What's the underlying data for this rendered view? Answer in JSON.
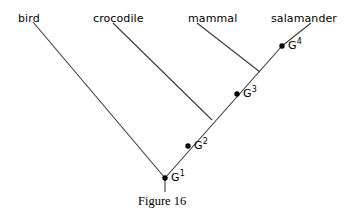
{
  "figure": {
    "caption": "Figure 16",
    "caption_x": 138,
    "caption_y": 194,
    "width": 358,
    "height": 221,
    "background_color": "#ffffff",
    "line_color": "#3a3a3a",
    "text_color": "#000000",
    "node_dot_color": "#000000"
  },
  "taxa": [
    {
      "label": "bird",
      "x": 18,
      "y": 13
    },
    {
      "label": "crocodile",
      "x": 93,
      "y": 13
    },
    {
      "label": "mammal",
      "x": 188,
      "y": 13
    },
    {
      "label": "salamander",
      "x": 271,
      "y": 13
    }
  ],
  "nodes": [
    {
      "label": "G",
      "sup": "1",
      "dot_x": 165,
      "dot_y": 178,
      "label_x": 171,
      "label_y": 172
    },
    {
      "label": "G",
      "sup": "2",
      "dot_x": 188,
      "dot_y": 146,
      "label_x": 194,
      "label_y": 140
    },
    {
      "label": "G",
      "sup": "3",
      "dot_x": 237,
      "dot_y": 94,
      "label_x": 243,
      "label_y": 88
    },
    {
      "label": "G",
      "sup": "4",
      "dot_x": 282,
      "dot_y": 46,
      "label_x": 288,
      "label_y": 40
    }
  ],
  "branches": [
    {
      "name": "bird-branch",
      "x1": 33,
      "y1": 22,
      "x2": 165,
      "y2": 178
    },
    {
      "name": "crocodile-branch",
      "x1": 113,
      "y1": 23,
      "x2": 212,
      "y2": 120
    },
    {
      "name": "mammal-branch",
      "x1": 197,
      "y1": 23,
      "x2": 260,
      "y2": 72
    },
    {
      "name": "salamander-branch",
      "x1": 311,
      "y1": 23,
      "x2": 282,
      "y2": 46
    },
    {
      "name": "spine",
      "x1": 165,
      "y1": 178,
      "x2": 282,
      "y2": 46
    },
    {
      "name": "root-stem",
      "x1": 165,
      "y1": 178,
      "x2": 165,
      "y2": 192
    }
  ],
  "chart_data": {
    "type": "diagram",
    "diagram_type": "phylogenetic-cladogram",
    "title": "Figure 16",
    "leaves": [
      "bird",
      "crocodile",
      "mammal",
      "salamander"
    ],
    "internal_nodes": [
      "G1",
      "G2",
      "G3",
      "G4"
    ],
    "topology": {
      "G1": {
        "children": [
          "bird",
          "G2"
        ]
      },
      "G2": {
        "children": [
          "crocodile",
          "G3"
        ]
      },
      "G3": {
        "children": [
          "mammal",
          "G4"
        ]
      },
      "G4": {
        "children": [
          "salamander"
        ]
      }
    },
    "root": "G1"
  }
}
